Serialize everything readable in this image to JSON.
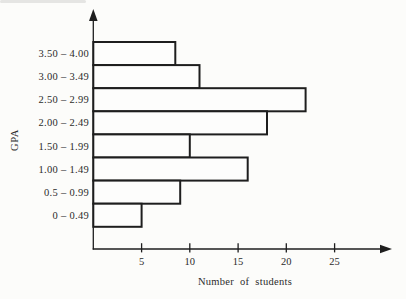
{
  "figure": {
    "background": "#fcfcfa",
    "ink_color": "#1e1e1e",
    "text_color": "#2b2b2b",
    "bar_fill": "#fdfdfc"
  },
  "chart_data": {
    "type": "bar",
    "orientation": "horizontal",
    "title": "",
    "xlabel": "Number of students",
    "ylabel": "GPA",
    "categories": [
      "3.50 – 4.00",
      "3.00 – 3.49",
      "2.50 – 2.99",
      "2.00 – 2.49",
      "1.50 – 1.99",
      "1.00 – 1.49",
      "0.5 – 0.99",
      "0 – 0.49"
    ],
    "values": [
      8.5,
      11,
      22,
      18,
      10,
      16,
      9,
      5
    ],
    "x_ticks": [
      5,
      10,
      15,
      20,
      25
    ],
    "xlim": [
      0,
      30
    ],
    "grid": false,
    "legend": "none",
    "bar_style": "outlined, white fill, adjacent rows (histogram)"
  }
}
